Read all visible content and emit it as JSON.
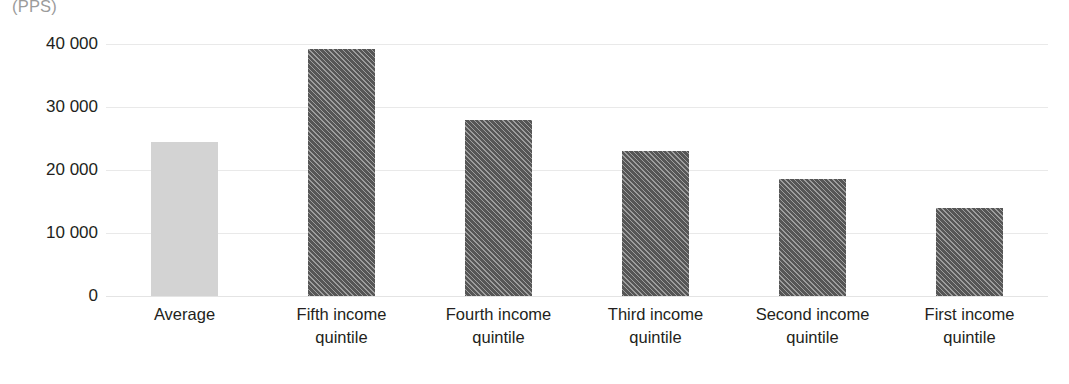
{
  "unit_label": "(PPS)",
  "chart_data": {
    "type": "bar",
    "title": "",
    "subtitle": "",
    "xlabel": "",
    "ylabel": "(PPS)",
    "ylim": [
      0,
      40000
    ],
    "ytick_values": [
      0,
      10000,
      20000,
      30000,
      40000
    ],
    "ytick_labels": [
      "0",
      "10 000",
      "20 000",
      "30 000",
      "40 000"
    ],
    "grid": true,
    "legend": "none",
    "categories": [
      "Average",
      "Fifth income quintile",
      "Fourth income quintile",
      "Third income quintile",
      "Second income quintile",
      "First income quintile"
    ],
    "category_lines": [
      [
        "Average",
        ""
      ],
      [
        "Fifth income",
        "quintile"
      ],
      [
        "Fourth income",
        "quintile"
      ],
      [
        "Third income",
        "quintile"
      ],
      [
        "Second income",
        "quintile"
      ],
      [
        "First income",
        "quintile"
      ]
    ],
    "values": [
      24400,
      39200,
      28000,
      23000,
      18600,
      13900
    ],
    "bar_styles": [
      "solid",
      "hatched",
      "hatched",
      "hatched",
      "hatched",
      "hatched"
    ],
    "colors": {
      "average_bar": "#d3d3d3",
      "quintile_bar": "#565656",
      "gridline": "#e9e9e9",
      "tick_text": "#231f20",
      "unit_text": "#9b9b9b",
      "background": "#ffffff"
    }
  }
}
